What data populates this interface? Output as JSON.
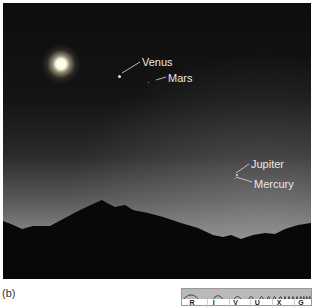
{
  "figure": {
    "panel_label": "(b)"
  },
  "photo": {
    "labels": {
      "venus": "Venus",
      "mars": "Mars",
      "jupiter": "Jupiter",
      "mercury": "Mercury"
    }
  },
  "spectrum_bar": {
    "bands": [
      "R",
      "I",
      "V",
      "U",
      "X",
      "G"
    ],
    "highlighted": "V",
    "band_color": "#b9b9b9"
  }
}
